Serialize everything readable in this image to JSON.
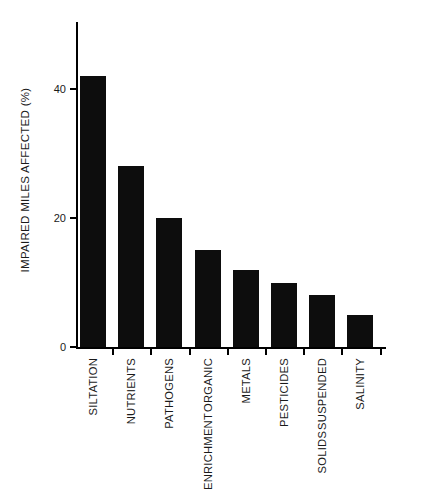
{
  "chart_data": {
    "type": "bar",
    "title": "",
    "subtitle": "",
    "xlabel": "",
    "ylabel": "IMPAIRED MILES AFFECTED (%)",
    "categories": [
      "SILTATION",
      "NUTRIENTS",
      "PATHOGENS",
      "ORGANIC ENRICHMENT",
      "METALS",
      "PESTICIDES",
      "SUSPENDED SOLIDS",
      "SALINITY"
    ],
    "category_lines": [
      [
        "SILTATION"
      ],
      [
        "NUTRIENTS"
      ],
      [
        "PATHOGENS"
      ],
      [
        "ORGANIC",
        "ENRICHMENT"
      ],
      [
        "METALS"
      ],
      [
        "PESTICIDES"
      ],
      [
        "SUSPENDED",
        "SOLIDS"
      ],
      [
        "SALINITY"
      ]
    ],
    "values": [
      42,
      28,
      20,
      15,
      12,
      10,
      8,
      5
    ],
    "ylim": [
      0,
      50
    ],
    "yticks": [
      0,
      20,
      40
    ],
    "ytick_labels": [
      "0",
      "20",
      "40"
    ],
    "grid": false,
    "legend": null,
    "bar_color": "#0d0d0d",
    "axis_color": "#000000",
    "background_color": "#ffffff",
    "orientation": "vertical"
  }
}
